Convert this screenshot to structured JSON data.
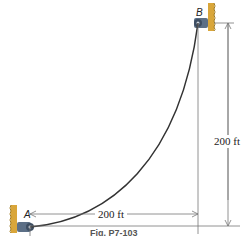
{
  "figure": {
    "point_a_label": "A",
    "point_b_label": "B",
    "horizontal_dimension": "200 ft",
    "vertical_dimension": "200 ft",
    "caption": "Fig. P7-103",
    "colors": {
      "cable": "#333333",
      "wall": "#d9a63a",
      "support": "#5c6f86",
      "dimension_line": "#777777"
    }
  }
}
